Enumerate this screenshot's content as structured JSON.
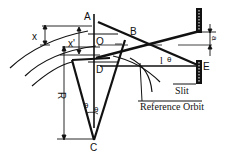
{
  "diagram": {
    "points": {
      "A": "A",
      "B": "B",
      "O": "O",
      "D": "D",
      "E": "E",
      "C": "C"
    },
    "symbols": {
      "x": "x",
      "x_prime": "x'",
      "R": "R",
      "l": "l",
      "theta": "θ",
      "a": "a"
    },
    "labels": {
      "slit": "Slit",
      "reference_orbit": "Reference Orbit"
    },
    "colors": {
      "stroke": "#111111",
      "background": "#ffffff"
    }
  }
}
